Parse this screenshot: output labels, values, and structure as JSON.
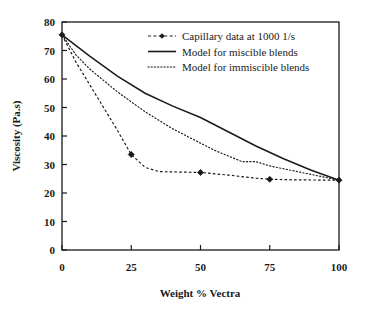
{
  "chart_data": {
    "type": "line",
    "title": "",
    "xlabel": "Weight % Vectra",
    "ylabel": "Viscosity (Pa.s)",
    "xlim": [
      0,
      100
    ],
    "ylim": [
      0,
      80
    ],
    "xticks": [
      0,
      25,
      50,
      75,
      100
    ],
    "yticks": [
      0,
      10,
      20,
      30,
      40,
      50,
      60,
      70,
      80
    ],
    "xtick_labels": [
      "0",
      "25",
      "50",
      "75",
      "100"
    ],
    "ytick_labels": [
      "0",
      "10",
      "20",
      "30",
      "40",
      "50",
      "60",
      "70",
      "80"
    ],
    "grid": false,
    "legend_position": "top-right",
    "series": [
      {
        "name": "Capillary data at 1000 1/s",
        "style": "dashed-with-markers",
        "marker": "filled-diamond",
        "color": "#1a1a1a",
        "points": [
          {
            "x": 0,
            "y": 75.5
          },
          {
            "x": 5,
            "y": 66.0
          },
          {
            "x": 10,
            "y": 58.0
          },
          {
            "x": 15,
            "y": 50.0
          },
          {
            "x": 20,
            "y": 42.0
          },
          {
            "x": 25,
            "y": 33.5
          },
          {
            "x": 30,
            "y": 29.0
          },
          {
            "x": 35,
            "y": 27.5
          },
          {
            "x": 40,
            "y": 27.4
          },
          {
            "x": 45,
            "y": 27.3
          },
          {
            "x": 50,
            "y": 27.2
          },
          {
            "x": 60,
            "y": 26.3
          },
          {
            "x": 70,
            "y": 25.2
          },
          {
            "x": 75,
            "y": 24.8
          },
          {
            "x": 85,
            "y": 24.6
          },
          {
            "x": 100,
            "y": 24.5
          }
        ],
        "marker_points": [
          {
            "x": 0,
            "y": 75.5
          },
          {
            "x": 25,
            "y": 33.5
          },
          {
            "x": 50,
            "y": 27.2
          },
          {
            "x": 75,
            "y": 24.8
          },
          {
            "x": 100,
            "y": 24.5
          }
        ]
      },
      {
        "name": "Model for miscible blends",
        "style": "solid",
        "color": "#1a1a1a",
        "points": [
          {
            "x": 0,
            "y": 75.5
          },
          {
            "x": 10,
            "y": 68.0
          },
          {
            "x": 20,
            "y": 61.0
          },
          {
            "x": 30,
            "y": 55.0
          },
          {
            "x": 40,
            "y": 50.5
          },
          {
            "x": 50,
            "y": 46.5
          },
          {
            "x": 60,
            "y": 41.5
          },
          {
            "x": 70,
            "y": 36.5
          },
          {
            "x": 80,
            "y": 32.0
          },
          {
            "x": 90,
            "y": 28.0
          },
          {
            "x": 100,
            "y": 24.5
          }
        ]
      },
      {
        "name": "Model for immiscible blends",
        "style": "dotted",
        "color": "#1a1a1a",
        "points": [
          {
            "x": 0,
            "y": 75.5
          },
          {
            "x": 5,
            "y": 68.5
          },
          {
            "x": 10,
            "y": 63.5
          },
          {
            "x": 15,
            "y": 59.5
          },
          {
            "x": 20,
            "y": 55.5
          },
          {
            "x": 25,
            "y": 52.0
          },
          {
            "x": 30,
            "y": 48.5
          },
          {
            "x": 35,
            "y": 45.5
          },
          {
            "x": 40,
            "y": 42.5
          },
          {
            "x": 45,
            "y": 40.0
          },
          {
            "x": 50,
            "y": 37.5
          },
          {
            "x": 55,
            "y": 35.0
          },
          {
            "x": 60,
            "y": 33.0
          },
          {
            "x": 65,
            "y": 31.0
          },
          {
            "x": 70,
            "y": 31.0
          },
          {
            "x": 75,
            "y": 29.5
          },
          {
            "x": 80,
            "y": 28.5
          },
          {
            "x": 85,
            "y": 27.5
          },
          {
            "x": 90,
            "y": 26.5
          },
          {
            "x": 95,
            "y": 25.5
          },
          {
            "x": 100,
            "y": 24.5
          }
        ]
      }
    ],
    "legend": [
      {
        "label": "Capillary data at 1000 1/s",
        "style": "dashed-with-markers"
      },
      {
        "label": "Model for miscible blends",
        "style": "solid"
      },
      {
        "label": "Model for immiscible blends",
        "style": "dotted"
      }
    ]
  },
  "colors": {
    "axis": "#1a1a1a",
    "background": "#ffffff",
    "series": "#1a1a1a"
  }
}
